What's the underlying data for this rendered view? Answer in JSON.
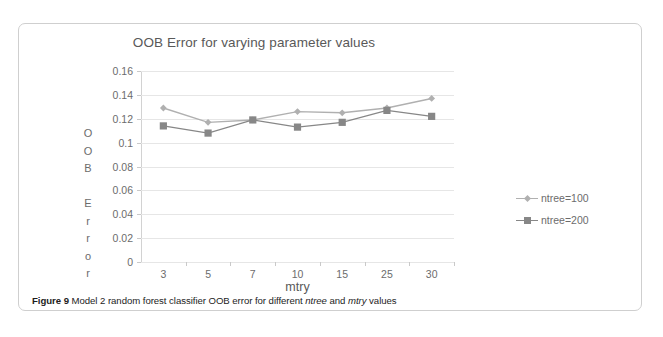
{
  "figure": {
    "caption_label": "Figure 9",
    "caption_text_1": "Model 2 random forest classifier OOB error for different",
    "caption_em_1": "ntree",
    "caption_text_2": "and",
    "caption_em_2": "mtry",
    "caption_text_3": "values"
  },
  "colors": {
    "series_1": "#b0b0b0",
    "series_2": "#878787",
    "gridline": "#e6e6e6",
    "axis": "#d2d2d2",
    "text": "#6c6c6c",
    "title_text": "#595959",
    "frame": "#cfcfcf",
    "background": "#ffffff"
  },
  "y_axis_title_letters": [
    "O",
    "O",
    "B",
    "",
    "E",
    "r",
    "r",
    "o",
    "r"
  ],
  "chart_data": {
    "type": "line",
    "title": "OOB Error for varying parameter values",
    "xlabel": "mtry",
    "ylabel": "OOB Error",
    "categories": [
      "3",
      "5",
      "7",
      "10",
      "15",
      "25",
      "30"
    ],
    "ylim": [
      0,
      0.16
    ],
    "yticks": [
      "0",
      "0.02",
      "0.04",
      "0.06",
      "0.08",
      "0.1",
      "0.12",
      "0.14",
      "0.16"
    ],
    "ytick_values": [
      0,
      0.02,
      0.04,
      0.06,
      0.08,
      0.1,
      0.12,
      0.14,
      0.16
    ],
    "grid": true,
    "legend_position": "right",
    "series": [
      {
        "name": "ntree=100",
        "marker": "diamond",
        "color": "#b0b0b0",
        "values": [
          0.129,
          0.117,
          0.119,
          0.126,
          0.125,
          0.129,
          0.137
        ]
      },
      {
        "name": "ntree=200",
        "marker": "square",
        "color": "#878787",
        "values": [
          0.114,
          0.108,
          0.119,
          0.113,
          0.117,
          0.127,
          0.122
        ]
      }
    ]
  }
}
